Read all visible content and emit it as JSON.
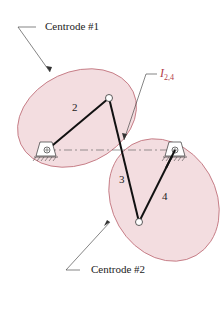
{
  "labels": {
    "centrode1": "Centrode #1",
    "centrode2": "Centrode #2",
    "instant_center": "I",
    "instant_center_sub": "2,4",
    "link2": "2",
    "link3": "3",
    "link4": "4"
  },
  "colors": {
    "centrode_fill": "#f3dde0",
    "centrode_stroke": "#c0707a",
    "link": "#111111",
    "instant_center_label": "#b23a48"
  }
}
